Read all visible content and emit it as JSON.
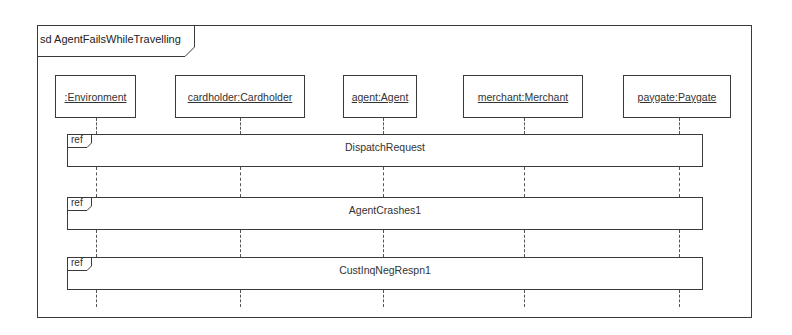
{
  "diagram": {
    "type": "UML sequence diagram",
    "frame": {
      "kind": "sd",
      "title": "sd AgentFailsWhileTravelling"
    },
    "lifelines": [
      {
        "label": ":Environment",
        "left": 55,
        "width": 81,
        "center": 96
      },
      {
        "label": "cardholder:Cardholder",
        "left": 175,
        "width": 130,
        "center": 240
      },
      {
        "label": "agent:Agent",
        "left": 343,
        "width": 74,
        "center": 383
      },
      {
        "label": "merchant:Merchant",
        "left": 463,
        "width": 120,
        "center": 524
      },
      {
        "label": "paygate:Paygate",
        "left": 623,
        "width": 108,
        "center": 679
      }
    ],
    "interaction_uses": [
      {
        "tag": "ref",
        "name": "DispatchRequest",
        "top": 134
      },
      {
        "tag": "ref",
        "name": "AgentCrashes1",
        "top": 197
      },
      {
        "tag": "ref",
        "name": "CustInqNegRespn1",
        "top": 257
      }
    ],
    "colors": {
      "line": "#3a3a3a",
      "text": "#333333",
      "background": "#ffffff"
    }
  }
}
